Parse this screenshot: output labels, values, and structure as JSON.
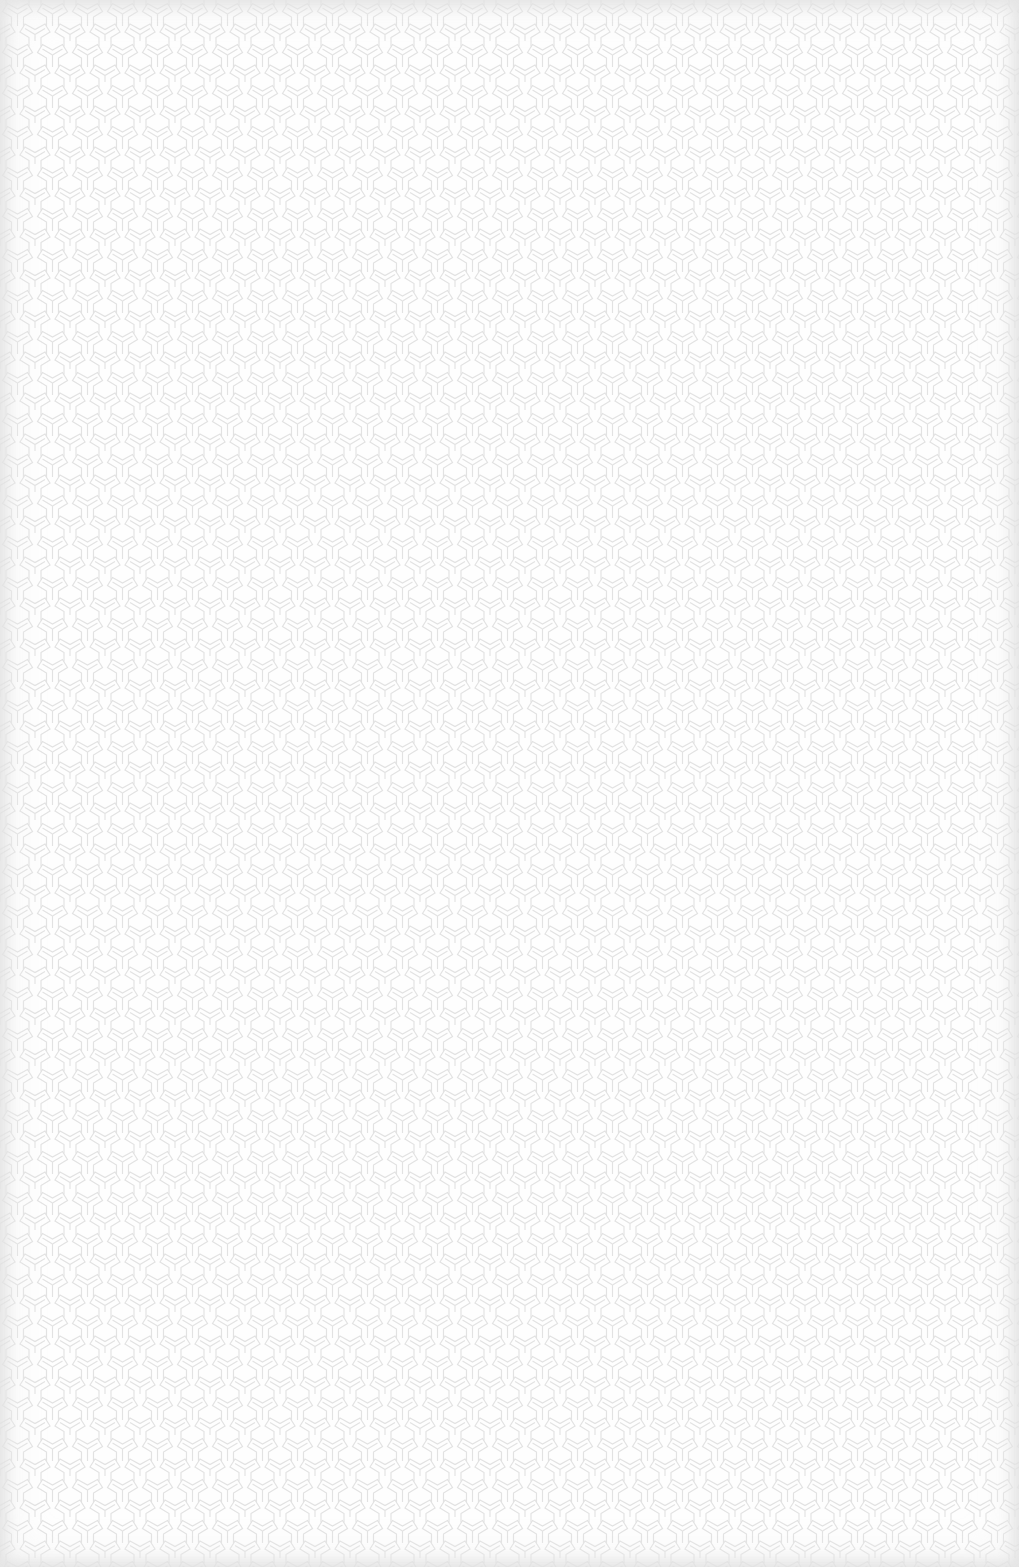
{
  "image": {
    "description": "Seamless light geometric texture of interlocking tri-arm Y motifs",
    "colors": {
      "background": "#fefefe",
      "line": "#e2e2e2",
      "vignette": "#e1e1e1"
    },
    "pattern": {
      "motif": "tri-arm-y",
      "tile_width": 35,
      "tile_height": 41
    }
  }
}
